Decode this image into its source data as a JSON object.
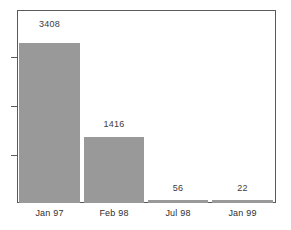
{
  "chart_data": {
    "type": "bar",
    "title": "",
    "subtitle": "",
    "xlabel": "",
    "ylabel": "",
    "categories": [
      "Jan 97",
      "Feb 98",
      "Jul 98",
      "Jan 99"
    ],
    "values": [
      3408,
      1416,
      56,
      22
    ],
    "value_labels": [
      "3408",
      "1416",
      "56",
      "22"
    ],
    "ylim": [
      0,
      4100
    ],
    "grid": false,
    "legend": null,
    "y_ticks_labeled": false,
    "y_tick_count": 3,
    "bar_color": "#999999",
    "frame_color": "#5a5a5a",
    "background": "#ffffff",
    "text_color": "#2e2e2e"
  }
}
